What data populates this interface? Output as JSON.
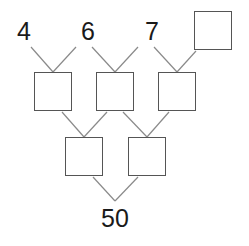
{
  "diagram": {
    "type": "number-pyramid",
    "top_row": [
      "4",
      "6",
      "7",
      ""
    ],
    "middle_row": [
      "",
      "",
      ""
    ],
    "lower_row": [
      "",
      ""
    ],
    "result": "50",
    "colors": {
      "line": "#7a7a7a",
      "box_border": "#555555",
      "text": "#1a1a1a"
    }
  }
}
